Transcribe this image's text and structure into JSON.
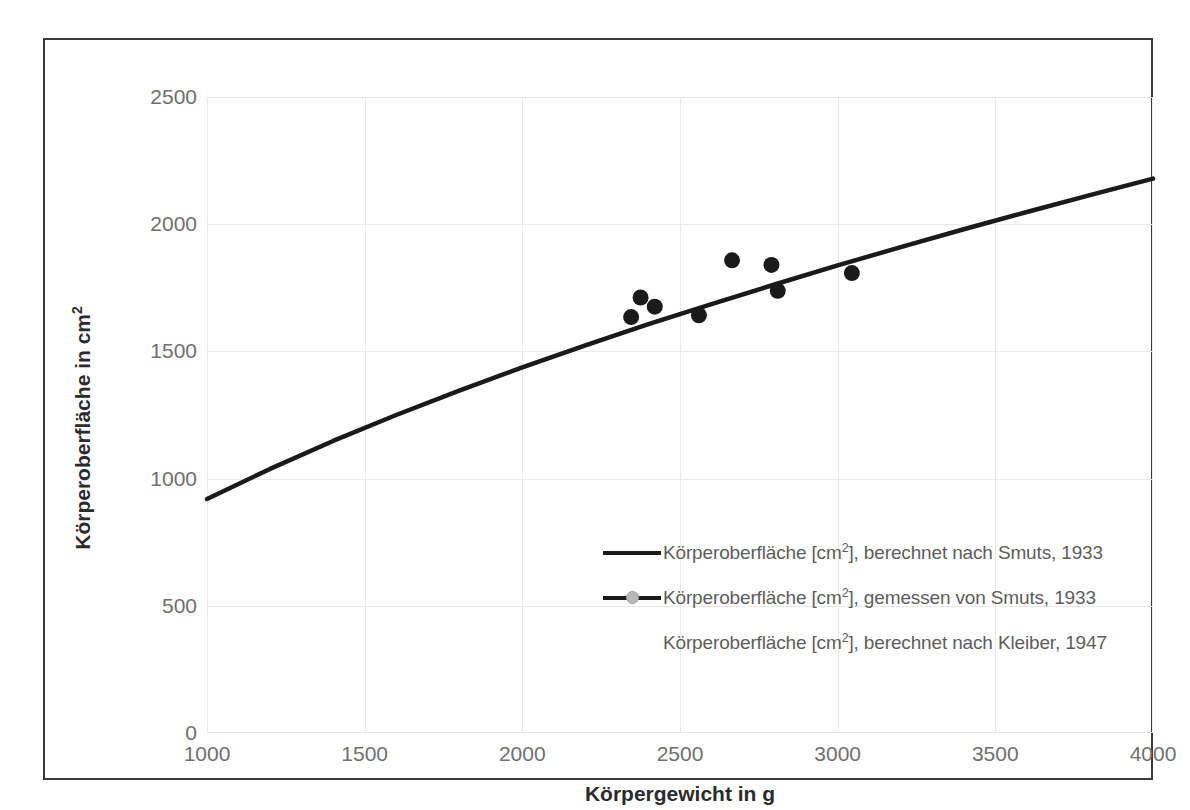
{
  "chart_data": {
    "type": "scatter",
    "title": "",
    "xlabel": "Körpergewicht in g",
    "ylabel": "Körperoberfläche in cm²",
    "xlim": [
      1000,
      4000
    ],
    "ylim": [
      0,
      2500
    ],
    "xticks": [
      "1000",
      "1500",
      "2000",
      "2500",
      "3000",
      "3500",
      "4000"
    ],
    "yticks": [
      "0",
      "500",
      "1000",
      "1500",
      "2000",
      "2500"
    ],
    "grid": true,
    "legend_position": "inside-lower-right",
    "series": [
      {
        "name": "Körperoberfläche [cm²], berechnet nach Smuts, 1933",
        "type": "line",
        "color": "#1a1a1a",
        "marker": "none",
        "x": [
          1000,
          1200,
          1400,
          1600,
          1800,
          2000,
          2200,
          2400,
          2600,
          2800,
          3000,
          3200,
          3400,
          3600,
          3800,
          4000
        ],
        "y": [
          920,
          1038,
          1148,
          1250,
          1346,
          1437,
          1524,
          1607,
          1686,
          1763,
          1838,
          1910,
          1980,
          2048,
          2114,
          2179
        ]
      },
      {
        "name": "Körperoberfläche [cm²], gemessen von Smuts, 1933",
        "type": "scatter",
        "color": "#1a1a1a",
        "marker": "circle",
        "x": [
          2345,
          2375,
          2420,
          2560,
          2665,
          2790,
          2810,
          3045
        ],
        "y": [
          1635,
          1712,
          1676,
          1642,
          1858,
          1840,
          1738,
          1808
        ]
      },
      {
        "name": "Körperoberfläche [cm²], berechnet nach Kleiber, 1947",
        "type": "line",
        "color": "#ffffff",
        "marker": "none",
        "x": [
          1000,
          4000
        ],
        "y": [
          null,
          null
        ]
      }
    ]
  },
  "axes": {
    "x_title": "Körpergewicht in g",
    "y_title_prefix": "Körperoberfläche in cm",
    "y_title_sup": "2",
    "x_ticks": [
      "1000",
      "1500",
      "2000",
      "2500",
      "3000",
      "3500",
      "4000"
    ],
    "y_ticks": [
      "2500",
      "2000",
      "1500",
      "1000",
      "500",
      "0"
    ]
  },
  "legend": {
    "items": [
      {
        "key": "solid-line",
        "prefix": "Körperoberfläche [cm",
        "sup": "2",
        "suffix": "], berechnet  nach Smuts, 1933"
      },
      {
        "key": "line-with-marker",
        "prefix": "Körperoberfläche [cm",
        "sup": "2",
        "suffix": "], gemessen von Smuts, 1933"
      },
      {
        "key": "blank",
        "prefix": "Körperoberfläche [cm",
        "sup": "2",
        "suffix": "], berechnet nach Kleiber, 1947"
      }
    ]
  }
}
